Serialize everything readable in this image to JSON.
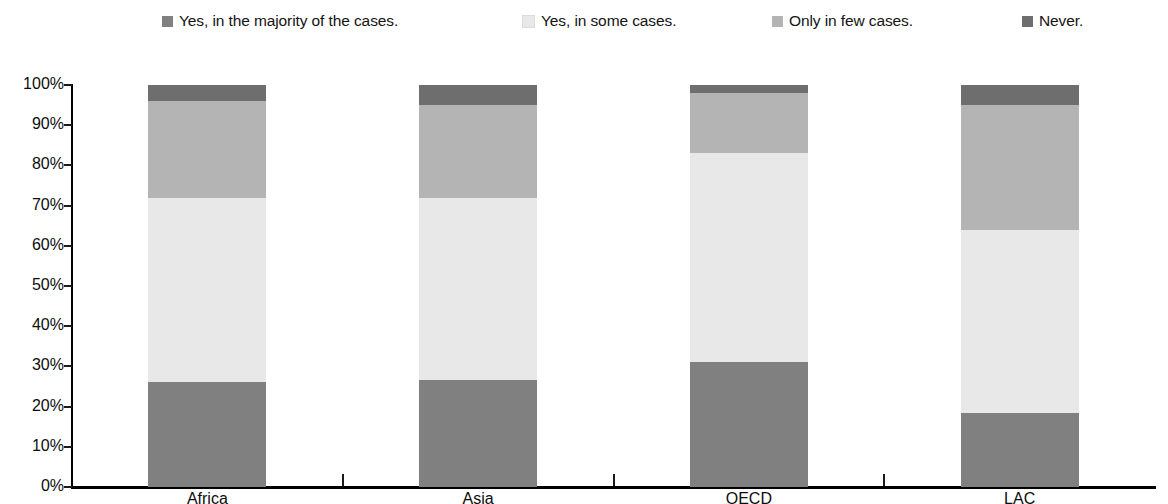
{
  "legend": {
    "position": "top",
    "items": [
      {
        "label": "Yes, in the majority of the cases.",
        "color": "#808080",
        "key": "majority"
      },
      {
        "label": "Yes, in some cases.",
        "color": "#e8e8e8",
        "key": "some"
      },
      {
        "label": "Only in few cases.",
        "color": "#b4b4b4",
        "key": "few"
      },
      {
        "label": "Never.",
        "color": "#6e6e6e",
        "key": "never"
      }
    ]
  },
  "y_axis": {
    "ticks": [
      "100%",
      "90%",
      "80%",
      "70%",
      "60%",
      "50%",
      "40%",
      "30%",
      "20%",
      "10%",
      "0%"
    ]
  },
  "x_axis": {
    "labels": [
      "Africa",
      "Asia",
      "OECD",
      "LAC"
    ]
  },
  "chart_data": {
    "type": "bar",
    "stacked": true,
    "stack_total": 100,
    "title": "",
    "subtitle": "",
    "xlabel": "",
    "ylabel": "",
    "ylim": [
      0,
      100
    ],
    "ytick_values": [
      0,
      10,
      20,
      30,
      40,
      50,
      60,
      70,
      80,
      90,
      100
    ],
    "ytick_labels": [
      "0%",
      "10%",
      "20%",
      "30%",
      "40%",
      "50%",
      "60%",
      "70%",
      "80%",
      "90%",
      "100%"
    ],
    "grid": false,
    "legend_position": "top",
    "categories": [
      "Africa",
      "Asia",
      "OECD",
      "LAC"
    ],
    "series": [
      {
        "name": "Yes, in the majority of the cases.",
        "color": "#808080",
        "values": [
          26,
          26.5,
          31,
          18.5
        ]
      },
      {
        "name": "Yes, in some cases.",
        "color": "#e8e8e8",
        "values": [
          46,
          45.5,
          52,
          45.5
        ]
      },
      {
        "name": "Only in few cases.",
        "color": "#b4b4b4",
        "values": [
          24,
          23,
          15,
          31
        ]
      },
      {
        "name": "Never.",
        "color": "#6e6e6e",
        "values": [
          4,
          5,
          2,
          5
        ]
      }
    ]
  }
}
